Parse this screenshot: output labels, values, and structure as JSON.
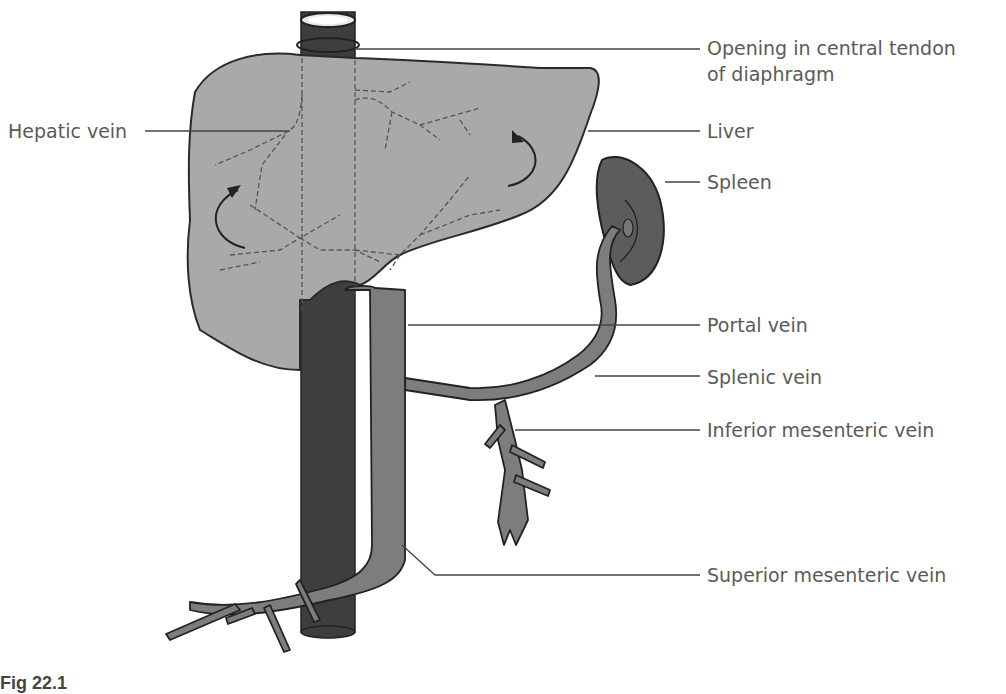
{
  "figure": {
    "caption_fragment": "Fig 22.1",
    "labels": {
      "opening": "Opening in central tendon",
      "opening_line2": "of diaphragm",
      "hepatic_vein": "Hepatic vein",
      "liver": "Liver",
      "spleen": "Spleen",
      "portal_vein": "Portal vein",
      "splenic_vein": "Splenic vein",
      "inferior_mesenteric_vein": "Inferior mesenteric vein",
      "superior_mesenteric_vein": "Superior mesenteric vein"
    },
    "colors": {
      "liver_fill": "#a9a9a9",
      "vein_fill": "#7d7d7d",
      "ivc_fill": "#3e3e3e",
      "spleen_fill": "#5c5c5c",
      "outline": "#2a2a2a",
      "label_text": "#5a5a5a"
    }
  }
}
